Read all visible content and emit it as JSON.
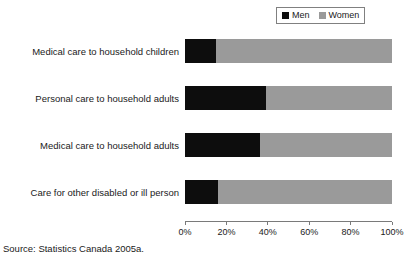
{
  "chart_data": {
    "type": "bar",
    "orientation": "horizontal",
    "stacked": true,
    "normalized": true,
    "title": "",
    "subtitle": "",
    "xlabel": "",
    "ylabel": "",
    "xlim": [
      0,
      100
    ],
    "grid": false,
    "legend_position": "top-right",
    "categories": [
      "Medical care to household children",
      "Personal care to household adults",
      "Medical care to household adults",
      "Care for other disabled or ill person"
    ],
    "x_tick_labels": [
      "0%",
      "20%",
      "40%",
      "60%",
      "80%",
      "100%"
    ],
    "x_tick_values": [
      0,
      20,
      40,
      60,
      80,
      100
    ],
    "series": [
      {
        "name": "Men",
        "color": "#0d0d0d",
        "values": [
          15,
          39,
          36,
          16
        ]
      },
      {
        "name": "Women",
        "color": "#9a9a9a",
        "values": [
          85,
          61,
          64,
          84
        ]
      }
    ]
  },
  "legend": {
    "entries": [
      {
        "label": "Men",
        "swatch_name": "legend-swatch-men"
      },
      {
        "label": "Women",
        "swatch_name": "legend-swatch-women"
      }
    ]
  },
  "source_note": "Source: Statistics Canada 2005a.",
  "colors": {
    "men": "#0d0d0d",
    "women": "#9a9a9a",
    "axis": "#7a7a7a",
    "legend_border": "#808080",
    "text": "#1a1a1a",
    "background": "#ffffff"
  }
}
